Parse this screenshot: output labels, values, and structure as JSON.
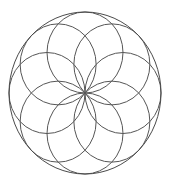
{
  "figure": {
    "name": "rosette-geometric-pattern",
    "background_color": "#ffffff",
    "canvas": {
      "width": 170,
      "height": 180
    }
  },
  "chart_data": {
    "type": "scatter",
    "subtitle": "",
    "xlabel": "",
    "ylabel": "",
    "xlim": [
      0,
      170
    ],
    "ylim": [
      0,
      180
    ],
    "grid": false,
    "legend_position": "none",
    "tick_labels": {
      "x": [],
      "y": []
    },
    "annotations": [],
    "geometry": {
      "center": {
        "x": 85,
        "y": 93
      },
      "outer_circle": {
        "cx": 85,
        "cy": 93,
        "rx": 76,
        "ry": 81
      },
      "inner_circle_count": 8,
      "inner_circle_rx": 38,
      "inner_circle_ry": 40.5,
      "inner_center_orbit_rx": 38,
      "inner_center_orbit_ry": 40.5,
      "start_angle_deg": -90,
      "angle_step_deg": 45,
      "petal_count": 8
    },
    "series": [
      {
        "name": "outer-circle",
        "kind": "ellipse",
        "stroke": "#4a4a4a",
        "stroke_width": 1,
        "values": [
          {
            "cx": 85,
            "cy": 93,
            "rx": 76,
            "ry": 81
          }
        ]
      },
      {
        "name": "inner-circles",
        "kind": "ellipse",
        "stroke": "#565656",
        "stroke_width": 1,
        "values": [
          {
            "index": 0,
            "angle_deg": -90,
            "cx": 85,
            "cy": 52.5,
            "rx": 38,
            "ry": 40.5
          },
          {
            "index": 1,
            "angle_deg": -45,
            "cx": 111.87,
            "cy": 64.36,
            "rx": 38,
            "ry": 40.5
          },
          {
            "index": 2,
            "angle_deg": 0,
            "cx": 123,
            "cy": 93,
            "rx": 38,
            "ry": 40.5
          },
          {
            "index": 3,
            "angle_deg": 45,
            "cx": 111.87,
            "cy": 121.64,
            "rx": 38,
            "ry": 40.5
          },
          {
            "index": 4,
            "angle_deg": 90,
            "cx": 85,
            "cy": 133.5,
            "rx": 38,
            "ry": 40.5
          },
          {
            "index": 5,
            "angle_deg": 135,
            "cx": 58.13,
            "cy": 121.64,
            "rx": 38,
            "ry": 40.5
          },
          {
            "index": 6,
            "angle_deg": 180,
            "cx": 47,
            "cy": 93,
            "rx": 38,
            "ry": 40.5
          },
          {
            "index": 7,
            "angle_deg": 225,
            "cx": 58.13,
            "cy": 64.36,
            "rx": 38,
            "ry": 40.5
          }
        ]
      }
    ]
  },
  "colors": {
    "background": "#ffffff",
    "outer_stroke": "#4a4a4a",
    "inner_stroke": "#565656"
  }
}
